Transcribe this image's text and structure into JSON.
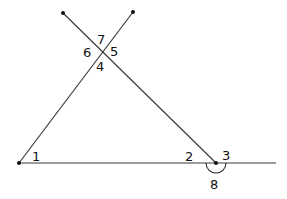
{
  "diagram": {
    "type": "geometry-angles",
    "points": {
      "top_left_end": [
        63,
        13
      ],
      "top_right_end": [
        133,
        12
      ],
      "intersection": [
        102,
        52
      ],
      "bottom_left": [
        19,
        163
      ],
      "bottom_right": [
        216,
        163
      ],
      "base_end": [
        276,
        163
      ]
    },
    "angle_labels": [
      {
        "id": "1",
        "text": "1",
        "x": 32,
        "y": 161
      },
      {
        "id": "2",
        "text": "2",
        "x": 185,
        "y": 161
      },
      {
        "id": "3",
        "text": "3",
        "x": 222,
        "y": 160
      },
      {
        "id": "4",
        "text": "4",
        "x": 96,
        "y": 71
      },
      {
        "id": "5",
        "text": "5",
        "x": 110,
        "y": 55
      },
      {
        "id": "6",
        "text": "6",
        "x": 83,
        "y": 57
      },
      {
        "id": "7",
        "text": "7",
        "x": 97,
        "y": 44
      },
      {
        "id": "8",
        "text": "8",
        "x": 210,
        "y": 189
      }
    ],
    "colors": {
      "line": "#3a3a3a",
      "point": "#111111",
      "label": "#111111"
    }
  }
}
